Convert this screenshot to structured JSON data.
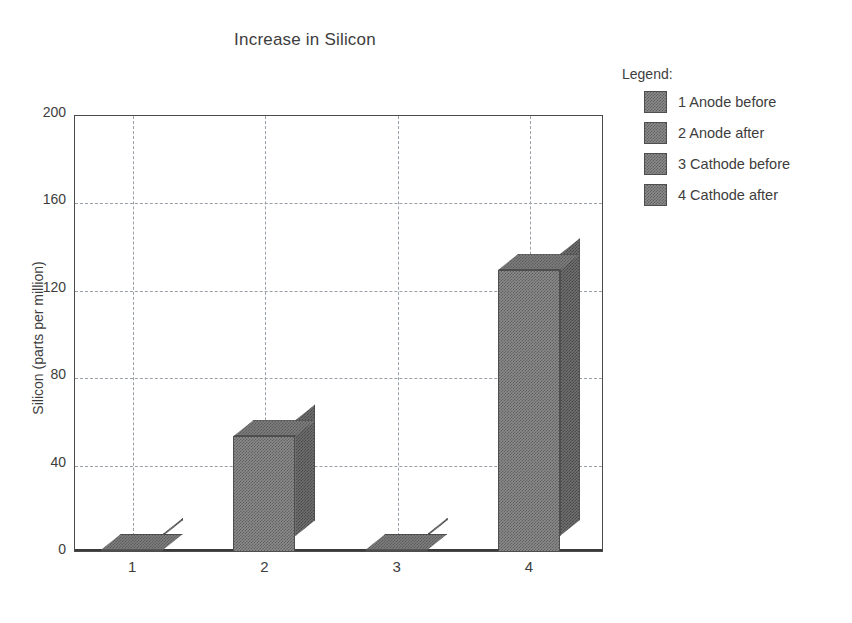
{
  "chart_data": {
    "type": "bar",
    "title": "Increase in Silicon",
    "xlabel": "",
    "ylabel": "Silicon (parts per million)",
    "categories": [
      "1",
      "2",
      "3",
      "4"
    ],
    "values": [
      1,
      53,
      1,
      129
    ],
    "ylim": [
      0,
      200
    ],
    "yticks": [
      0,
      40,
      80,
      120,
      160,
      200
    ],
    "ytick_labels": [
      "0",
      "40",
      "80",
      "120",
      "160",
      "200"
    ],
    "grid": true,
    "grid_style": "dashed",
    "three_d": true,
    "legend_position": "right",
    "series": [
      {
        "name": "Silicon (parts per million)",
        "values": [
          1,
          53,
          1,
          129
        ]
      }
    ],
    "legend_entries": [
      "1 Anode before",
      "2 Anode after",
      "3 Cathode before",
      "4 Cathode after"
    ]
  },
  "legend": {
    "title": "Legend:",
    "items": [
      {
        "label": "1 Anode before"
      },
      {
        "label": "2 Anode after"
      },
      {
        "label": "3 Cathode before"
      },
      {
        "label": "4 Cathode after"
      }
    ]
  },
  "colors": {
    "bar_front": "#8a8a8a",
    "bar_side": "#6f6f6f",
    "bar_top": "#7d7d7d",
    "bar_outline": "#4e4e4e",
    "gridline": "#9aa0a8",
    "axis": "#3a3a3a",
    "text": "#3d3d3d",
    "background": "#ffffff"
  }
}
